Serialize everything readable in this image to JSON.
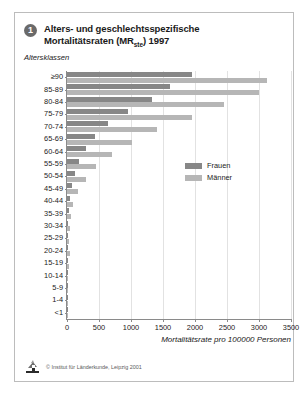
{
  "card": {
    "badge_number": "1",
    "title_line1": "Alters- und geschlechtsspezifische",
    "title_line2_pre": "Mortalitätsraten (MR",
    "title_line2_sub": "ste",
    "title_line2_post": ") 1997",
    "y_caption": "Altersklassen",
    "copyright": "© Institut für Länderkunde, Leipzig 2001",
    "logo_icon": "institute-logo-icon"
  },
  "legend": {
    "position": "inside-right",
    "entries": [
      {
        "label": "Frauen",
        "color": "#878787"
      },
      {
        "label": "Männer",
        "color": "#b6b6b6"
      }
    ]
  },
  "chart_data": {
    "type": "bar",
    "orientation": "horizontal",
    "title": "Alters- und geschlechtsspezifische Mortalitätsraten (MRste) 1997",
    "xlabel": "Mortalitätsrate pro 100000 Personen",
    "ylabel": "Altersklassen",
    "xlim": [
      0,
      3500
    ],
    "xticks": [
      0,
      500,
      1000,
      1500,
      2000,
      2500,
      3000,
      3500
    ],
    "xticklabels": [
      "0",
      "500",
      "1000",
      "1500",
      "2000",
      "2500",
      "3000",
      "3500"
    ],
    "grid": true,
    "grid_axis": "x",
    "legend_position": "inside-right",
    "categories": [
      "≥90",
      "85-89",
      "80-84",
      "75-79",
      "70-74",
      "65-69",
      "60-64",
      "55-59",
      "50-54",
      "45-49",
      "40-44",
      "35-39",
      "30-34",
      "25-29",
      "20-24",
      "15-19",
      "10-14",
      "5-9",
      "1-4",
      "<1"
    ],
    "series": [
      {
        "name": "Frauen",
        "color": "#878787",
        "values": [
          1960,
          1610,
          1330,
          950,
          640,
          440,
          290,
          190,
          125,
          80,
          50,
          30,
          20,
          14,
          12,
          10,
          6,
          5,
          6,
          10
        ]
      },
      {
        "name": "Männer",
        "color": "#b6b6b6",
        "values": [
          3130,
          3000,
          2450,
          1950,
          1400,
          1010,
          700,
          450,
          290,
          175,
          100,
          65,
          45,
          35,
          40,
          30,
          10,
          6,
          8,
          12
        ]
      }
    ]
  }
}
